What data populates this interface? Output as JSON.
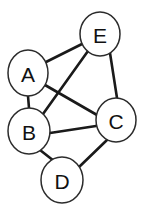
{
  "diagram": {
    "background_color": "#ffffff",
    "node_fill_color": "#ffffff",
    "node_stroke_color": "#2b2b2b",
    "edge_color": "#1a1a1a",
    "label_color": "#111111"
  },
  "chart_data": {
    "type": "diagram",
    "graph_type": "undirected",
    "node_count": 5,
    "edge_count": 8,
    "nodes": [
      {
        "id": "A",
        "label": "A",
        "cx": 28,
        "cy": 73,
        "rx": 20,
        "ry": 23
      },
      {
        "id": "E",
        "label": "E",
        "cx": 100,
        "cy": 34,
        "rx": 20,
        "ry": 22
      },
      {
        "id": "B",
        "label": "B",
        "cx": 29,
        "cy": 131,
        "rx": 21,
        "ry": 23
      },
      {
        "id": "C",
        "label": "C",
        "cx": 116,
        "cy": 120,
        "rx": 20,
        "ry": 22
      },
      {
        "id": "D",
        "label": "D",
        "cx": 62,
        "cy": 180,
        "rx": 21,
        "ry": 23
      }
    ],
    "edges": [
      {
        "id": "A-E",
        "from": "A",
        "to": "E",
        "x1": 46,
        "y1": 62,
        "x2": 82,
        "y2": 44
      },
      {
        "id": "A-B",
        "from": "A",
        "to": "B",
        "x1": 28,
        "y1": 96,
        "x2": 29,
        "y2": 108
      },
      {
        "id": "A-C",
        "from": "A",
        "to": "C",
        "x1": 45,
        "y1": 85,
        "x2": 97,
        "y2": 115
      },
      {
        "id": "B-E",
        "from": "B",
        "to": "E",
        "x1": 43,
        "y1": 114,
        "x2": 88,
        "y2": 51
      },
      {
        "id": "B-C",
        "from": "B",
        "to": "C",
        "x1": 50,
        "y1": 133,
        "x2": 96,
        "y2": 126
      },
      {
        "id": "B-D",
        "from": "B",
        "to": "D",
        "x1": 40,
        "y1": 150,
        "x2": 54,
        "y2": 161
      },
      {
        "id": "C-D",
        "from": "C",
        "to": "D",
        "x1": 107,
        "y1": 140,
        "x2": 78,
        "y2": 168
      },
      {
        "id": "C-E",
        "from": "C",
        "to": "E",
        "x1": 117,
        "y1": 98,
        "x2": 110,
        "y2": 53
      }
    ]
  }
}
